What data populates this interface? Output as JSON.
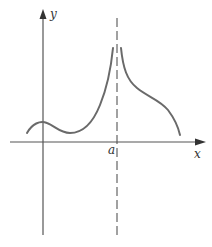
{
  "figure": {
    "axes": {
      "x_label": "x",
      "y_label": "y"
    },
    "asymptote": {
      "label": "a",
      "style": "dashed vertical line at x = a"
    },
    "curve": {
      "description": "Function with local max near y-axis, local min, then rising to +infinity as x approaches a from left and from right; decreasing toward x-axis on right side"
    },
    "colors": {
      "axis": "#555555",
      "curve": "#6a6a6a",
      "text": "#333333",
      "background": "#ffffff"
    }
  }
}
